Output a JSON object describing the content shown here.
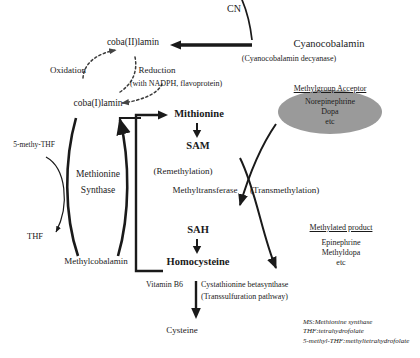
{
  "figure": {
    "background_color": "#ffffff",
    "ink_color": "#1a1a1a",
    "ellipse_fill": "#9a9a9a"
  },
  "cyanocobalamin_branch": {
    "product": "CN",
    "substrate": "Cyanocobalamin",
    "enzyme": "(Cyanocobalamin decyanase)"
  },
  "cobalamin_redox": {
    "oxidized": "coba(II)lamin",
    "reduced": "coba(I)lamin",
    "oxidation_label": "Oxidation",
    "reduction_label": "Reduction",
    "reduction_cofactors": "(with NADPH, flavoprotein)"
  },
  "methionine_synthase_cycle": {
    "enzyme_line1": "Methionine",
    "enzyme_line2": "Synthase",
    "top_node": "coba(I)lamin",
    "bottom_node": "Methylcobalamin",
    "methyl_donor": "5-methy-THF",
    "methyl_donor_product": "THF"
  },
  "methionine_cycle": {
    "methionine": "Mithionine",
    "sam": "SAM",
    "sah": "SAH",
    "homocysteine": "Homocysteine",
    "remethylation_label": "(Remethylation)",
    "methyltransferase_label": "Methyltransferase",
    "transmethylation_label": "(Transmethylation)"
  },
  "acceptor": {
    "heading": "Methylgroup Acceptor",
    "items": [
      "Norepinephrine",
      "Dopa",
      "etc"
    ]
  },
  "methylated_product": {
    "heading": "Methylated product",
    "items": [
      "Epinephrine",
      "Methyldopa",
      "etc"
    ]
  },
  "transsulfuration": {
    "cofactor": "Vitamin B6",
    "enzyme": "Cystathionine betasynthase",
    "pathway_label": "(Transsulfuration pathway)",
    "product": "Cysteine"
  },
  "abbreviations": [
    "MS:Methionine synthase",
    "THF:tetrahydrofolate",
    "5-methyl-THF:methyltetrahydrofolate"
  ]
}
